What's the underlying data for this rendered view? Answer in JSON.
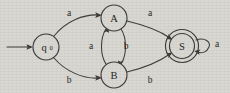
{
  "figure": {
    "background_color": "#d9d7d2",
    "ink_color": "#3a3a38",
    "width": 230,
    "height": 93
  },
  "states": [
    {
      "id": "q0",
      "label": "q",
      "subscript": "0",
      "kind": "start",
      "accepting": false,
      "cx": 46,
      "cy": 47,
      "r": 13
    },
    {
      "id": "A",
      "label": "A",
      "subscript": "",
      "kind": "normal",
      "accepting": false,
      "cx": 114,
      "cy": 18,
      "r": 13
    },
    {
      "id": "B",
      "label": "B",
      "subscript": "",
      "kind": "normal",
      "accepting": false,
      "cx": 114,
      "cy": 75,
      "r": 13
    },
    {
      "id": "S",
      "label": "S",
      "subscript": "",
      "kind": "accept",
      "accepting": true,
      "cx": 182,
      "cy": 46,
      "r": 13,
      "outer_r": 16.5
    }
  ],
  "start_marker": {
    "name": "start-arrow",
    "from_x": 7,
    "to_x": 31,
    "y": 47
  },
  "transitions": [
    {
      "id": "q0-A",
      "from": "q0",
      "to": "A",
      "symbol": "a",
      "label_x": 69,
      "label_y": 13
    },
    {
      "id": "q0-B",
      "from": "q0",
      "to": "B",
      "symbol": "b",
      "label_x": 69,
      "label_y": 80
    },
    {
      "id": "B-A",
      "from": "B",
      "to": "A",
      "symbol": "a",
      "label_x": 91,
      "label_y": 46
    },
    {
      "id": "A-B",
      "from": "A",
      "to": "B",
      "symbol": "b",
      "label_x": 126,
      "label_y": 46
    },
    {
      "id": "A-S",
      "from": "A",
      "to": "S",
      "symbol": "a",
      "label_x": 150,
      "label_y": 13
    },
    {
      "id": "B-S",
      "from": "B",
      "to": "S",
      "symbol": "b",
      "label_x": 150,
      "label_y": 80
    },
    {
      "id": "S-S",
      "from": "S",
      "to": "S",
      "symbol": "a",
      "label_x": 216,
      "label_y": 44,
      "self_loop": true
    }
  ]
}
